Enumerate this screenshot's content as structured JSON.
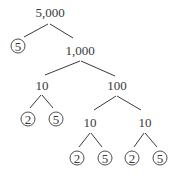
{
  "diagram": {
    "type": "factor-tree",
    "root": "5,000",
    "nodes": {
      "n5000": "5,000",
      "n5a": "5",
      "n1000": "1,000",
      "n10a": "10",
      "n100": "100",
      "n2a": "2",
      "n5b": "5",
      "n10b": "10",
      "n10c": "10",
      "n2b": "2",
      "n5c": "5",
      "n2c": "2",
      "n5d": "5"
    },
    "edges": [
      [
        "5,000",
        "5"
      ],
      [
        "5,000",
        "1,000"
      ],
      [
        "1,000",
        "10"
      ],
      [
        "1,000",
        "100"
      ],
      [
        "10",
        "2"
      ],
      [
        "10",
        "5"
      ],
      [
        "100",
        "10"
      ],
      [
        "100",
        "10"
      ],
      [
        "10",
        "2"
      ],
      [
        "10",
        "5"
      ],
      [
        "10",
        "2"
      ],
      [
        "10",
        "5"
      ]
    ],
    "prime_factors_circled": [
      "5",
      "2",
      "5",
      "2",
      "5",
      "2",
      "5"
    ],
    "colors": {
      "ink": "#3a3a3a",
      "background": "#ffffff"
    }
  }
}
